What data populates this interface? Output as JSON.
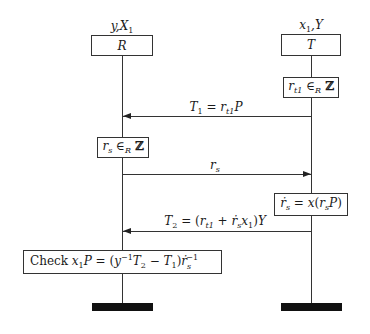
{
  "diagram": {
    "type": "sequence",
    "participants": [
      {
        "id": "R",
        "label": "R",
        "holds": "y,X₁"
      },
      {
        "id": "T",
        "label": "T",
        "holds": "x₁,Y"
      }
    ],
    "steps": {
      "t_random": "r_t1 ∈_R ℤ",
      "msg1": "T₁ = r_t1 P",
      "r_random": "r_s ∈_R ℤ",
      "msg2": "r_s",
      "t_compute": "ṙ_s = x(r_s P)",
      "msg3": "T₂ = (r_t1 + ṙ_s x₁)Y",
      "check": "Check x₁P = (y⁻¹T₂ − T₁)ṙ_s⁻¹"
    },
    "messages": [
      {
        "from": "T",
        "to": "R",
        "label": "T₁ = r_t1 P"
      },
      {
        "from": "R",
        "to": "T",
        "label": "r_s"
      },
      {
        "from": "T",
        "to": "R",
        "label": "T₂ = (r_t1 + ṙ_s x₁)Y"
      }
    ],
    "colors": {
      "line": "#333333",
      "bar": "#111111",
      "background": "#ffffff"
    }
  }
}
